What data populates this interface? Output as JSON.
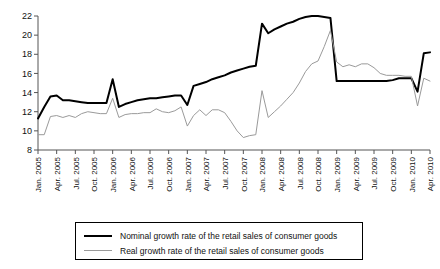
{
  "chart_data": {
    "type": "line",
    "title": "",
    "xlabel": "",
    "ylabel": "",
    "ylim": [
      8,
      22
    ],
    "ytick_step": 2,
    "yticks": [
      8,
      10,
      12,
      14,
      16,
      18,
      20,
      22
    ],
    "grid": false,
    "legend_position": "bottom",
    "x_tick_labels": [
      "Jan. 2005",
      "Apr. 2005",
      "Jul. 2005",
      "Oct. 2005",
      "Jan. 2006",
      "Apr. 2006",
      "Jul. 2006",
      "Oct. 2006",
      "Jan. 2007",
      "Apr. 2007",
      "Jul. 2007",
      "Oct. 2007",
      "Jan. 2008",
      "Apr. 2008",
      "Jul. 2008",
      "Oct. 2008",
      "Jan. 2009",
      "Apr. 2009",
      "Jul. 2009",
      "Oct. 2009",
      "Jan. 2010",
      "Apr. 2010"
    ],
    "x": [
      "Jan. 2005",
      "Feb. 2005",
      "Mar. 2005",
      "Apr. 2005",
      "May 2005",
      "Jun. 2005",
      "Jul. 2005",
      "Aug. 2005",
      "Sep. 2005",
      "Oct. 2005",
      "Nov. 2005",
      "Dec. 2005",
      "Jan. 2006",
      "Feb. 2006",
      "Mar. 2006",
      "Apr. 2006",
      "May 2006",
      "Jun. 2006",
      "Jul. 2006",
      "Aug. 2006",
      "Sep. 2006",
      "Oct. 2006",
      "Nov. 2006",
      "Dec. 2006",
      "Jan. 2007",
      "Feb. 2007",
      "Mar. 2007",
      "Apr. 2007",
      "May 2007",
      "Jun. 2007",
      "Jul. 2007",
      "Aug. 2007",
      "Sep. 2007",
      "Oct. 2007",
      "Nov. 2007",
      "Dec. 2007",
      "Jan. 2008",
      "Feb. 2008",
      "Mar. 2008",
      "Apr. 2008",
      "May 2008",
      "Jun. 2008",
      "Jul. 2008",
      "Aug. 2008",
      "Sep. 2008",
      "Oct. 2008",
      "Nov. 2008",
      "Dec. 2008",
      "Jan. 2009",
      "Feb. 2009",
      "Mar. 2009",
      "Apr. 2009",
      "May 2009",
      "Jun. 2009",
      "Jul. 2009",
      "Aug. 2009",
      "Sep. 2009",
      "Oct. 2009",
      "Nov. 2009",
      "Dec. 2009",
      "Jan. 2010",
      "Feb. 2010",
      "Mar. 2010",
      "Apr. 2010"
    ],
    "series": [
      {
        "name": "Nominal growth rate of the retail sales of consumer goods",
        "color": "#000000",
        "width": 2,
        "values": [
          11.3,
          12.5,
          13.6,
          13.7,
          13.2,
          13.2,
          13.1,
          13.0,
          12.9,
          12.9,
          12.9,
          12.9,
          15.4,
          12.5,
          12.8,
          13.0,
          13.2,
          13.3,
          13.4,
          13.4,
          13.5,
          13.6,
          13.7,
          13.7,
          12.7,
          14.7,
          14.9,
          15.1,
          15.4,
          15.6,
          15.8,
          16.1,
          16.3,
          16.5,
          16.7,
          16.8,
          21.2,
          20.2,
          20.6,
          20.9,
          21.2,
          21.4,
          21.7,
          21.9,
          22.0,
          22.0,
          21.9,
          21.8,
          15.2,
          15.2,
          15.2,
          15.2,
          15.2,
          15.2,
          15.2,
          15.2,
          15.2,
          15.3,
          15.5,
          15.5,
          15.5,
          14.1,
          18.1,
          18.2
        ]
      },
      {
        "name": "Real growth rate of the retail sales of consumer goods",
        "color": "#9a9a9a",
        "width": 1,
        "values": [
          9.6,
          9.6,
          11.5,
          11.6,
          11.4,
          11.6,
          11.4,
          11.8,
          12.0,
          11.9,
          11.8,
          11.8,
          13.4,
          11.4,
          11.7,
          11.8,
          11.8,
          11.9,
          11.9,
          12.3,
          12.0,
          11.9,
          12.1,
          12.5,
          10.5,
          11.6,
          12.2,
          11.6,
          12.2,
          12.2,
          11.9,
          11.0,
          10.0,
          9.3,
          9.5,
          9.6,
          14.2,
          11.4,
          12.0,
          12.6,
          13.3,
          14.0,
          15.0,
          16.2,
          17.0,
          17.3,
          18.8,
          20.5,
          17.2,
          16.7,
          16.9,
          16.7,
          17.0,
          17.0,
          16.6,
          16.0,
          15.8,
          15.8,
          15.8,
          15.7,
          15.7,
          12.6,
          15.5,
          15.2
        ]
      }
    ]
  },
  "legend": {
    "items": [
      {
        "label": "Nominal growth rate of the retail sales of consumer goods",
        "style": "nominal"
      },
      {
        "label": "Real growth rate of the retail sales of consumer goods",
        "style": "real"
      }
    ]
  }
}
